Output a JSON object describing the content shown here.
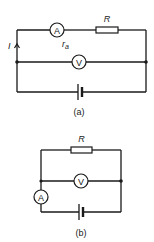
{
  "diagrams": [
    {
      "id": "a",
      "caption": "(a)",
      "resistor_label": "R",
      "ammeter_label": "A",
      "voltmeter_label": "V",
      "current_label": "I",
      "ammeter_resistance_label": "r",
      "ammeter_resistance_subscript": "a"
    },
    {
      "id": "b",
      "caption": "(b)",
      "resistor_label": "R",
      "ammeter_label": "A",
      "voltmeter_label": "V"
    }
  ],
  "colors": {
    "ink": "#1a1a1a",
    "background": "#ffffff"
  }
}
